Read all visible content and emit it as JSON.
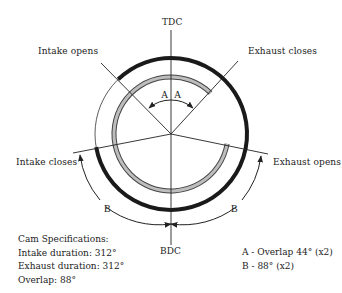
{
  "diagram": {
    "labels": {
      "tdc": "TDC",
      "bdc": "BDC",
      "intake_opens": "Intake opens",
      "exhaust_closes": "Exhaust closes",
      "intake_closes": "Intake closes",
      "exhaust opens": "Exhaust opens",
      "exhaust_opens": "Exhaust opens",
      "angle_a": "A",
      "angle_b": "B"
    },
    "specs": {
      "title": "Cam Specifications:",
      "intake_duration": "Intake duration: 312°",
      "exhaust_duration": "Exhaust duration: 312°",
      "overlap": "Overlap: 88°"
    },
    "legend": {
      "a": "A - Overlap 44° (x2)",
      "b": "B - 88° (x2)"
    },
    "colors": {
      "ink": "#222222",
      "intake_arc": "#1a1a1a",
      "exhaust_arc": "#aaaaaa"
    }
  }
}
